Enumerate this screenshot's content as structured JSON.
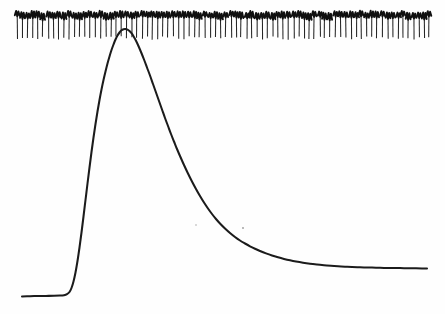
{
  "figure": {
    "background_color": "#fefefe",
    "ink_color": "#1b1b1b",
    "width": 445,
    "height": 314,
    "title": "",
    "has_axes": false,
    "has_labels": false,
    "has_legend": false
  },
  "chart_data": {
    "type": "line",
    "title": "",
    "subtitle": "",
    "xlabel": "",
    "ylabel": "",
    "xlim": [
      0,
      445
    ],
    "ylim": [
      314,
      0
    ],
    "grid": false,
    "legend": null,
    "annotations": [],
    "tick_labels": {
      "x": [],
      "y": []
    },
    "series": [
      {
        "name": "response-curve",
        "stroke": "#1b1b1b",
        "stroke_width": 2.05,
        "peak_x": 118,
        "peak_y": 29,
        "baseline_y": 296,
        "start_x": 22,
        "end_x": 427,
        "end_y": 268,
        "points": [
          [
            22,
            296.5
          ],
          [
            30,
            296.2
          ],
          [
            38,
            296.0
          ],
          [
            46,
            295.9
          ],
          [
            54,
            295.8
          ],
          [
            60,
            295.6
          ],
          [
            64,
            295.2
          ],
          [
            67,
            294.2
          ],
          [
            69.5,
            292.0
          ],
          [
            71.5,
            288.0
          ],
          [
            73.5,
            281.5
          ],
          [
            75.5,
            272.5
          ],
          [
            77.5,
            261.0
          ],
          [
            79.5,
            247.5
          ],
          [
            81.5,
            232.5
          ],
          [
            83.5,
            216.5
          ],
          [
            85.5,
            200.0
          ],
          [
            87.5,
            183.5
          ],
          [
            89.5,
            167.5
          ],
          [
            91.5,
            152.0
          ],
          [
            93.5,
            137.5
          ],
          [
            95.5,
            124.0
          ],
          [
            97.5,
            111.5
          ],
          [
            99.5,
            100.0
          ],
          [
            101.5,
            89.5
          ],
          [
            103.5,
            80.0
          ],
          [
            105.5,
            71.5
          ],
          [
            107.5,
            63.5
          ],
          [
            109.5,
            56.5
          ],
          [
            111.5,
            50.0
          ],
          [
            113.5,
            44.5
          ],
          [
            115.5,
            39.5
          ],
          [
            117.5,
            35.5
          ],
          [
            119.5,
            32.5
          ],
          [
            121.5,
            30.3
          ],
          [
            123.5,
            29.2
          ],
          [
            125.5,
            29.0
          ],
          [
            127.5,
            29.6
          ],
          [
            129.5,
            31.0
          ],
          [
            131.5,
            33.2
          ],
          [
            133.5,
            36.2
          ],
          [
            135.5,
            39.8
          ],
          [
            138,
            45.0
          ],
          [
            141,
            52.0
          ],
          [
            144,
            59.5
          ],
          [
            147,
            67.5
          ],
          [
            150,
            75.5
          ],
          [
            153,
            84.0
          ],
          [
            156,
            92.5
          ],
          [
            159,
            101.0
          ],
          [
            162,
            109.5
          ],
          [
            165,
            118.0
          ],
          [
            168,
            126.0
          ],
          [
            171,
            134.0
          ],
          [
            174,
            141.5
          ],
          [
            177,
            149.0
          ],
          [
            180,
            156.0
          ],
          [
            184,
            165.0
          ],
          [
            188,
            173.5
          ],
          [
            192,
            181.5
          ],
          [
            196,
            189.0
          ],
          [
            200,
            196.0
          ],
          [
            204,
            202.5
          ],
          [
            208,
            208.5
          ],
          [
            212,
            214.0
          ],
          [
            216,
            219.0
          ],
          [
            220,
            223.5
          ],
          [
            225,
            228.5
          ],
          [
            230,
            233.0
          ],
          [
            235,
            237.0
          ],
          [
            240,
            240.5
          ],
          [
            245,
            243.5
          ],
          [
            250,
            246.3
          ],
          [
            255,
            248.8
          ],
          [
            260,
            251.0
          ],
          [
            266,
            253.4
          ],
          [
            272,
            255.5
          ],
          [
            278,
            257.3
          ],
          [
            284,
            258.9
          ],
          [
            290,
            260.3
          ],
          [
            296,
            261.5
          ],
          [
            303,
            262.7
          ],
          [
            310,
            263.7
          ],
          [
            317,
            264.5
          ],
          [
            324,
            265.2
          ],
          [
            331,
            265.8
          ],
          [
            338,
            266.3
          ],
          [
            345,
            266.7
          ],
          [
            352,
            267.0
          ],
          [
            360,
            267.3
          ],
          [
            368,
            267.5
          ],
          [
            376,
            267.7
          ],
          [
            384,
            267.9
          ],
          [
            392,
            268.0
          ],
          [
            400,
            268.1
          ],
          [
            408,
            268.2
          ],
          [
            416,
            268.3
          ],
          [
            422,
            268.4
          ],
          [
            427,
            268.5
          ]
        ]
      }
    ],
    "comb": {
      "name": "tick-comb",
      "count": 80,
      "x_start": 17,
      "x_end": 430,
      "period": 5.22,
      "stem_top_y": 16,
      "stem_bottom_y": 38,
      "hook_top_y": 12,
      "stem_color": "#262626",
      "hook_color": "#101010"
    },
    "specks": [
      {
        "x": 243,
        "y": 228,
        "r": 0.9
      },
      {
        "x": 196,
        "y": 225,
        "r": 0.7
      }
    ]
  }
}
